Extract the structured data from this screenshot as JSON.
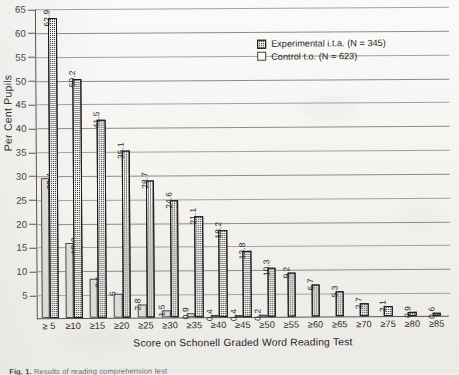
{
  "chart_data": {
    "type": "bar",
    "title": "",
    "xlabel": "Score on Schonell Graded Word Reading Test",
    "ylabel": "Per Cent Pupils",
    "ylim": [
      0,
      65
    ],
    "ytick_step": 5,
    "yticks": [
      "65",
      "60",
      "55",
      "50",
      "45",
      "40",
      "35",
      "30",
      "25",
      "20",
      "15",
      "10",
      "5"
    ],
    "grid": true,
    "legend_position": "top-right",
    "categories": [
      "≥ 5",
      "≥10",
      "≥15",
      "≥20",
      "≥25",
      "≥30",
      "≥35",
      "≥40",
      "≥45",
      "≥50",
      "≥55",
      "≥60",
      "≥65",
      "≥70",
      "≥75",
      "≥80",
      "≥85"
    ],
    "series": [
      {
        "name": "Experimental i.t.a. (N = 345)",
        "values": [
          62.9,
          50.2,
          41.5,
          35.1,
          28.7,
          24.6,
          21.1,
          18.2,
          13.8,
          10.3,
          9.2,
          6.7,
          5.3,
          2.7,
          2.1,
          0.9,
          0.6
        ],
        "labels": [
          "62.9",
          "50.2",
          "41.5",
          "35.1",
          "28.7",
          "24.6",
          "21.1",
          "18.2",
          "13.8",
          "10.3",
          "9.2",
          "6.7",
          "5.3",
          "2.7",
          "2.1",
          "0.9",
          "0.6"
        ]
      },
      {
        "name": "Control t.o. (N = 623)",
        "values": [
          29.4,
          15.8,
          8.1,
          5,
          2.8,
          1.5,
          0.9,
          0.4,
          0.4,
          0.2,
          0,
          0,
          0,
          0,
          0,
          0,
          0
        ],
        "labels": [
          "29.4",
          "15.8",
          "8.1",
          "5",
          "2.8",
          "1.5",
          "0.9",
          "0.4",
          "0.4",
          "0.2",
          "",
          "",
          "",
          "",
          "",
          "",
          ""
        ]
      }
    ]
  },
  "legend": {
    "experimental": "Experimental i.t.a. (N = 345)",
    "control": "Control t.o. (N = 623)"
  },
  "caption": {
    "label": "Fig. 1.",
    "text": "Results of reading comprehension test"
  }
}
